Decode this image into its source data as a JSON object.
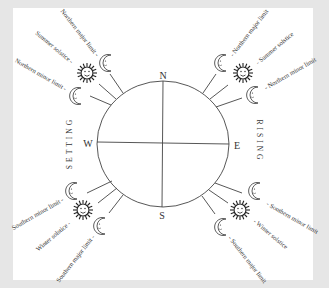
{
  "diagram": {
    "compass": {
      "north": "N",
      "south": "S",
      "east": "E",
      "west": "W"
    },
    "side_labels": {
      "left": "SETTING",
      "right": "RISING"
    },
    "quadrants": {
      "northwest": [
        {
          "icon": "moon-icon",
          "label": "Northern major limit -"
        },
        {
          "icon": "sun-icon",
          "label": "Summer solstice -"
        },
        {
          "icon": "moon-icon",
          "label": "Northern minor limit -"
        }
      ],
      "northeast": [
        {
          "icon": "moon-icon",
          "label": "- Northern major limit"
        },
        {
          "icon": "sun-icon",
          "label": "- Summer solstice"
        },
        {
          "icon": "moon-icon",
          "label": "- Northern minor limit"
        }
      ],
      "southwest": [
        {
          "icon": "moon-icon",
          "label": "Southern minor limit -"
        },
        {
          "icon": "sun-icon",
          "label": "Winter solstice -"
        },
        {
          "icon": "moon-icon",
          "label": "Southern major limit -"
        }
      ],
      "southeast": [
        {
          "icon": "moon-icon",
          "label": "- Southern minor limit"
        },
        {
          "icon": "sun-icon",
          "label": "- Winter solstice"
        },
        {
          "icon": "moon-icon",
          "label": "- Southern major limit"
        }
      ]
    },
    "colors": {
      "ink": "#333333",
      "paper": "#ffffff",
      "background": "#e6e6e6"
    }
  }
}
